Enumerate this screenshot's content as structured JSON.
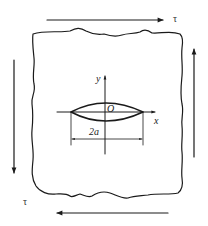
{
  "diagram": {
    "labels": {
      "tau_top": "τ",
      "tau_bottom_left": "τ",
      "y_axis": "y",
      "x_axis": "x",
      "origin": "O",
      "crack_length": "2a"
    },
    "arrows": [
      {
        "id": "top",
        "direction": "right",
        "from": [
          47,
          20
        ],
        "to": [
          164,
          20
        ]
      },
      {
        "id": "bottom",
        "direction": "left",
        "from": [
          168,
          213
        ],
        "to": [
          56,
          213
        ]
      },
      {
        "id": "left",
        "direction": "down",
        "from": [
          14,
          60
        ],
        "to": [
          14,
          174
        ]
      },
      {
        "id": "right",
        "direction": "up",
        "from": [
          194,
          157
        ],
        "to": [
          194,
          48
        ]
      }
    ],
    "colors": {
      "stroke": "#1a1a1a",
      "background": "#ffffff"
    }
  }
}
